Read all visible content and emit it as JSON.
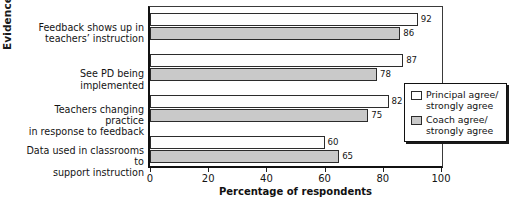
{
  "chart_data": {
    "type": "bar",
    "orientation": "horizontal",
    "title": "",
    "xlabel": "Percentage of respondents",
    "ylabel": "Evidence",
    "xlim": [
      0,
      100
    ],
    "xticks": [
      0,
      20,
      40,
      60,
      80,
      100
    ],
    "xtick_labels": [
      "0",
      "20",
      "40",
      "60",
      "80",
      "100"
    ],
    "grid": false,
    "legend_position": "bottom-right",
    "categories": [
      "Feedback shows up in teachers' instruction",
      "See PD being implemented",
      "Teachers changing practice in response to feedback",
      "Data used in classrooms to support instruction"
    ],
    "category_lines": [
      [
        "Feedback shows up in",
        "teachers’ instruction"
      ],
      [
        "See PD being implemented"
      ],
      [
        "Teachers changing practice",
        "in response to feedback"
      ],
      [
        "Data used in classrooms to",
        "support instruction"
      ]
    ],
    "series": [
      {
        "name": "Principal agree/strongly agree",
        "color": "#ffffff",
        "values": [
          92,
          87,
          82,
          60
        ]
      },
      {
        "name": "Coach agree/strongly agree",
        "color": "#c9c9c9",
        "values": [
          86,
          78,
          75,
          65
        ]
      }
    ]
  },
  "legend": {
    "entries": [
      {
        "lines": [
          "Principal agree/",
          "strongly agree"
        ],
        "swatch": "white-swatch"
      },
      {
        "lines": [
          "Coach agree/",
          "strongly agree"
        ],
        "swatch": "gray-swatch"
      }
    ]
  },
  "colors": {
    "principal_fill": "#ffffff",
    "coach_fill": "#c9c9c9",
    "outline": "#2b2b2b",
    "axis": "#111111"
  }
}
